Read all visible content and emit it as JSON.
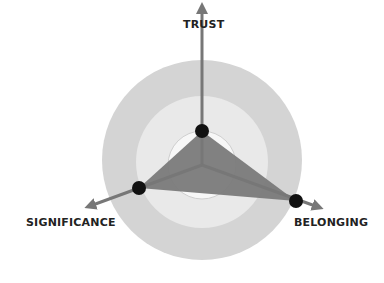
{
  "diagram": {
    "type": "radar",
    "axes": [
      {
        "key": "trust",
        "label": "TRUST"
      },
      {
        "key": "significance",
        "label": "SIGNIFICANCE"
      },
      {
        "key": "belonging",
        "label": "BELONGING"
      }
    ],
    "colors": {
      "outer_ring": "#d4d4d4",
      "middle_ring": "#e9e9e9",
      "inner_ring": "#f7f7f7",
      "axis": "#777777",
      "triangle": "#7a7a7a",
      "dot": "#111111",
      "label": "#222222"
    },
    "rings": 3
  }
}
